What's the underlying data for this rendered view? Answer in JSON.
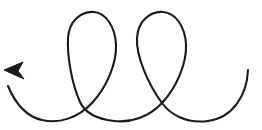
{
  "figure": {
    "canvas": {
      "width": 262,
      "height": 130,
      "background_color": "#ffffff"
    },
    "stroke": {
      "color": "#1a1a1a",
      "width": 2.1,
      "linecap": "round",
      "linejoin": "round",
      "fill": "none"
    },
    "arrowhead": {
      "name": "arrowhead",
      "color": "#1a1a1a",
      "tip_x": 4,
      "tip_y": 70,
      "direction": "up-left",
      "angle_degrees": 222,
      "length": 19,
      "width": 11,
      "points": "4,70 24,79 18,71 23,62"
    },
    "geometry": {
      "start_point": {
        "x": 248,
        "y": 70
      },
      "end_point": {
        "x": 4,
        "y": 70
      },
      "loop_count": 2,
      "loop_top_y": 12,
      "trough_y": 121,
      "crossings": [
        {
          "x": 92,
          "y": 103
        },
        {
          "x": 162,
          "y": 103
        }
      ],
      "loops": [
        {
          "left_x": 67,
          "right_x": 116,
          "apex_x": 93,
          "apex_y": 12
        },
        {
          "left_x": 137,
          "right_x": 186,
          "apex_x": 163,
          "apex_y": 12
        }
      ],
      "path": "M 248 70 C 247 96 232 118 208 121 C 186 124 170 114 162 103 C 148 84 136 56 137 38 C 138 21 150 11 163 12 C 176 13 185 27 186 44 C 187 64 176 88 162 103 C 149 117 131 123 114 121 C 97 119 85 113 80 102 C 72 84 67 57 68 38 C 69 21 81 11 94 12 C 106 13 115 27 116 44 C 117 64 106 88 92 103 C 78 118 59 124 42 120 C 28 117 16 105 8 86"
    }
  }
}
